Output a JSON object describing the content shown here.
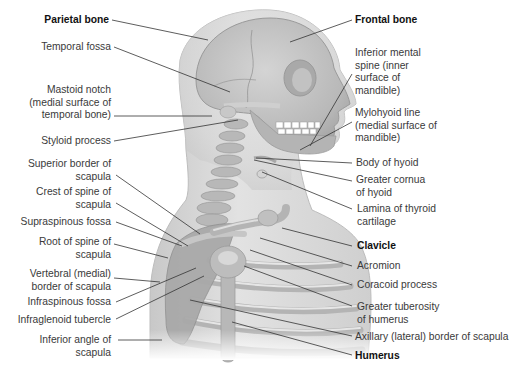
{
  "figure": {
    "colors": {
      "background": "#ffffff",
      "skin": "#dcdcdc",
      "bone": "#bdbdbd",
      "bone_highlight": "#e6e6e6",
      "leader_line": "#333333",
      "label_text": "#3a3a3a",
      "bold_label_text": "#111111"
    }
  },
  "labels_left": [
    {
      "id": "parietal-bone",
      "text": "Parietal bone",
      "bold": true
    },
    {
      "id": "temporal-fossa",
      "text": "Temporal fossa",
      "bold": false
    },
    {
      "id": "mastoid-notch",
      "line1": "Mastoid notch",
      "line2": "(medial surface of",
      "line3": "temporal bone)",
      "bold": false
    },
    {
      "id": "styloid-process",
      "text": "Styloid process",
      "bold": false
    },
    {
      "id": "superior-border-scapula",
      "line1": "Superior border of",
      "line2": "scapula",
      "bold": false
    },
    {
      "id": "crest-spine-scapula",
      "line1": "Crest of spine of",
      "line2": "scapula",
      "bold": false
    },
    {
      "id": "supraspinous-fossa",
      "text": "Supraspinous fossa",
      "bold": false
    },
    {
      "id": "root-spine-scapula",
      "line1": "Root of spine of",
      "line2": "scapula",
      "bold": false
    },
    {
      "id": "vertebral-border-scapula",
      "line1": "Vertebral (medial)",
      "line2": "border of scapula",
      "bold": false
    },
    {
      "id": "infraspinous-fossa",
      "text": "Infraspinous fossa",
      "bold": false
    },
    {
      "id": "infraglenoid-tubercle",
      "text": "Infraglenoid tubercle",
      "bold": false
    },
    {
      "id": "inferior-angle-scapula",
      "line1": "Inferior angle of",
      "line2": "scapula",
      "bold": false
    }
  ],
  "labels_right": [
    {
      "id": "frontal-bone",
      "text": "Frontal bone",
      "bold": true
    },
    {
      "id": "inferior-mental-spine",
      "line1": "Inferior mental",
      "line2": "spine (inner",
      "line3": "surface of",
      "line4": "mandible)",
      "bold": false
    },
    {
      "id": "mylohyoid-line",
      "line1": "Mylohyoid line",
      "line2": "(medial surface of",
      "line3": "mandible)",
      "bold": false
    },
    {
      "id": "body-of-hyoid",
      "text": "Body of hyoid",
      "bold": false
    },
    {
      "id": "greater-cornua-hyoid",
      "line1": "Greater cornua",
      "line2": "of hyoid",
      "bold": false
    },
    {
      "id": "lamina-thyroid-cartilage",
      "line1": "Lamina of thyroid",
      "line2": "cartilage",
      "bold": false
    },
    {
      "id": "clavicle",
      "text": "Clavicle",
      "bold": true
    },
    {
      "id": "acromion",
      "text": "Acromion",
      "bold": false
    },
    {
      "id": "coracoid-process",
      "text": "Coracoid process",
      "bold": false
    },
    {
      "id": "greater-tuberosity-humerus",
      "line1": "Greater tuberosity",
      "line2": "of humerus",
      "bold": false
    },
    {
      "id": "axillary-border-scapula",
      "text": "Axillary (lateral) border of scapula",
      "bold": false
    },
    {
      "id": "humerus",
      "text": "Humerus",
      "bold": true
    }
  ]
}
